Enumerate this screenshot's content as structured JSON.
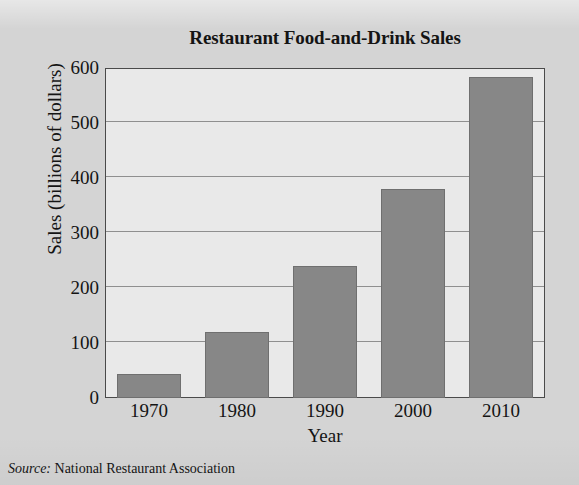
{
  "chart_data": {
    "type": "bar",
    "title": "Restaurant Food-and-Drink Sales",
    "categories": [
      "1970",
      "1980",
      "1990",
      "2000",
      "2010"
    ],
    "values": [
      43,
      120,
      240,
      380,
      583
    ],
    "xlabel": "Year",
    "ylabel": "Sales (billions of dollars)",
    "ylim": [
      0,
      600
    ],
    "ytick_labels": [
      "0",
      "100",
      "200",
      "300",
      "400",
      "500",
      "600"
    ],
    "ytick_values": [
      0,
      100,
      200,
      300,
      400,
      500,
      600
    ],
    "grid": "horizontal",
    "legend": "none",
    "bar_color": "#878787",
    "plot_background": "#e9e9e9",
    "page_background": "#d4d4d4",
    "axis_color": "#4a4a4a",
    "gridline_color": "#8f8f8f",
    "text_color": "#141414"
  },
  "source": {
    "label": "Source:",
    "value": " National Restaurant Association"
  }
}
